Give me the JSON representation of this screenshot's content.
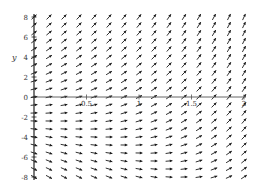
{
  "chart_data": {
    "type": "direction_field",
    "title": "",
    "xlabel": "",
    "ylabel": "y",
    "xlim": [
      0,
      2
    ],
    "ylim": [
      -8,
      8
    ],
    "x_ticks": [
      {
        "value": 0.5,
        "label": "0.5"
      },
      {
        "value": 1,
        "label": "1"
      },
      {
        "value": 1.5,
        "label": "1.5"
      },
      {
        "value": 2,
        "label": "2"
      }
    ],
    "y_ticks": [
      {
        "value": 8,
        "label": "8"
      },
      {
        "value": 6,
        "label": "6"
      },
      {
        "value": 4,
        "label": "4"
      },
      {
        "value": 2,
        "label": "2"
      },
      {
        "value": 0,
        "label": "0"
      },
      {
        "value": -2,
        "label": "-2"
      },
      {
        "value": -4,
        "label": "-4"
      },
      {
        "value": -6,
        "label": "-6"
      },
      {
        "value": -8,
        "label": "-8"
      }
    ],
    "grid": false,
    "field": {
      "description": "slope field approximately dy/dx = y + 2e^x",
      "nx": 15,
      "ny": 21,
      "zero_slope_at": {
        "x": 0,
        "y": -2
      }
    },
    "colors": {
      "arrow": "#1a1a1a",
      "axis": "#555555"
    }
  },
  "plot_area": {
    "left_px": 34,
    "right_px": 244,
    "top_px": 17,
    "bottom_px": 177
  }
}
